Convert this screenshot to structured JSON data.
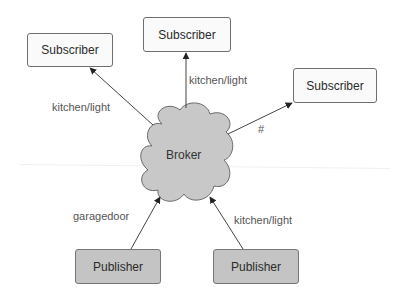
{
  "diagram": {
    "type": "publish-subscribe",
    "broker": {
      "label": "Broker",
      "fill": "#c8c8c8"
    },
    "subscribers": [
      {
        "id": "sub-left",
        "label": "Subscriber",
        "topic": "kitchen/light"
      },
      {
        "id": "sub-top",
        "label": "Subscriber",
        "topic": "kitchen/light"
      },
      {
        "id": "sub-right",
        "label": "Subscriber",
        "topic": "#"
      }
    ],
    "publishers": [
      {
        "id": "pub-left",
        "label": "Publisher",
        "topic": "garagedoor"
      },
      {
        "id": "pub-right",
        "label": "Publisher",
        "topic": "kitchen/light"
      }
    ],
    "colors": {
      "subscriber_fill": "#fafafa",
      "publisher_fill": "#c4c4c4",
      "stroke": "#444444",
      "label_text": "#555555"
    }
  }
}
